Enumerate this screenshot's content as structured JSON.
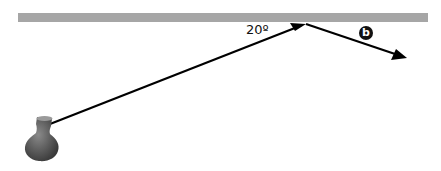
{
  "diagram": {
    "surface": {
      "color": "#a6a6a6",
      "x1": 18,
      "x2": 428,
      "y": 13,
      "height": 9
    },
    "incident_ray": {
      "from": [
        44,
        126
      ],
      "to": [
        305,
        24
      ],
      "color": "#000000"
    },
    "reflected_ray": {
      "from": [
        305,
        24
      ],
      "to": [
        406,
        58
      ],
      "color": "#000000"
    },
    "angle_label": "20º",
    "badge_label": "b",
    "source_object": "vase-icon"
  }
}
